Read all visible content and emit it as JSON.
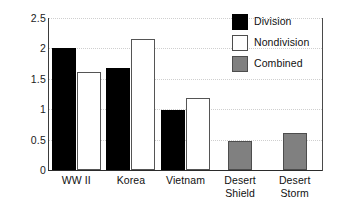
{
  "chart_data": {
    "type": "bar",
    "title": "",
    "xlabel": "",
    "ylabel": "",
    "ylim": [
      0,
      2.5
    ],
    "yticks": [
      "0",
      "0.5",
      "1",
      "1.5",
      "2",
      "2.5"
    ],
    "ytick_values": [
      0,
      0.5,
      1,
      1.5,
      2,
      2.5
    ],
    "grid": true,
    "legend_position": "top-right",
    "categories": [
      "WW II",
      "Korea",
      "Vietnam",
      "Desert Shield",
      "Desert Storm"
    ],
    "category_lines": [
      [
        "WW II"
      ],
      [
        "Korea"
      ],
      [
        "Vietnam"
      ],
      [
        "Desert",
        "Shield"
      ],
      [
        "Desert",
        "Storm"
      ]
    ],
    "series": [
      {
        "name": "Division",
        "color": "#000000",
        "values": [
          2.0,
          1.68,
          0.99,
          null,
          null
        ]
      },
      {
        "name": "Nondivision",
        "color": "#ffffff",
        "values": [
          1.61,
          2.15,
          1.19,
          null,
          null
        ]
      },
      {
        "name": "Combined",
        "color": "#808080",
        "values": [
          null,
          null,
          null,
          0.48,
          0.61
        ]
      }
    ],
    "bars": [
      {
        "category": "WW II",
        "series": "Division",
        "value": 2.0,
        "style": "division"
      },
      {
        "category": "WW II",
        "series": "Nondivision",
        "value": 1.61,
        "style": "nondivision"
      },
      {
        "category": "Korea",
        "series": "Division",
        "value": 1.68,
        "style": "division"
      },
      {
        "category": "Korea",
        "series": "Nondivision",
        "value": 2.15,
        "style": "nondivision"
      },
      {
        "category": "Vietnam",
        "series": "Division",
        "value": 0.99,
        "style": "division"
      },
      {
        "category": "Vietnam",
        "series": "Nondivision",
        "value": 1.19,
        "style": "nondivision"
      },
      {
        "category": "Desert Shield",
        "series": "Combined",
        "value": 0.48,
        "style": "combined"
      },
      {
        "category": "Desert Storm",
        "series": "Combined",
        "value": 0.61,
        "style": "combined"
      }
    ]
  },
  "legend": {
    "items": [
      {
        "label": "Division",
        "style": "division"
      },
      {
        "label": "Nondivision",
        "style": "nondivision"
      },
      {
        "label": "Combined",
        "style": "combined"
      }
    ]
  },
  "colors": {
    "division": "#000000",
    "nondivision": "#ffffff",
    "combined": "#808080",
    "axis": "#2b2b2b",
    "grid": "#cfcfcf",
    "text": "#111111",
    "background": "#ffffff"
  }
}
